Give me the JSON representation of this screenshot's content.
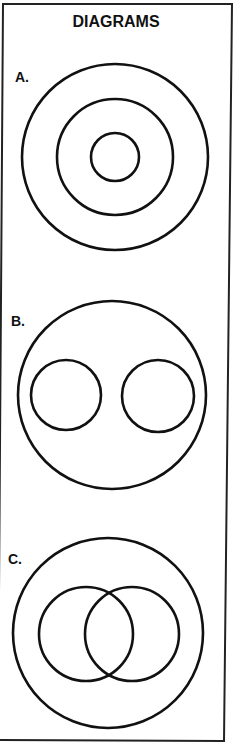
{
  "title": "DIAGRAMS",
  "colors": {
    "stroke": "#111111",
    "background": "#ffffff"
  },
  "diagrams": [
    {
      "label": "A.",
      "description": "Three concentric circles",
      "circles": [
        {
          "cx": 115,
          "cy": 157,
          "r": 93
        },
        {
          "cx": 115,
          "cy": 157,
          "r": 58
        },
        {
          "cx": 115,
          "cy": 157,
          "r": 24
        }
      ]
    },
    {
      "label": "B.",
      "description": "Large circle containing two separate non-overlapping circles",
      "circles": [
        {
          "cx": 112,
          "cy": 395,
          "r": 94
        },
        {
          "cx": 66,
          "cy": 395,
          "r": 35
        },
        {
          "cx": 158,
          "cy": 396,
          "r": 36
        }
      ]
    },
    {
      "label": "C.",
      "description": "Large circle containing two overlapping circles",
      "circles": [
        {
          "cx": 108,
          "cy": 633,
          "r": 95
        },
        {
          "cx": 86,
          "cy": 634,
          "r": 47
        },
        {
          "cx": 132,
          "cy": 634,
          "r": 47
        }
      ]
    }
  ]
}
